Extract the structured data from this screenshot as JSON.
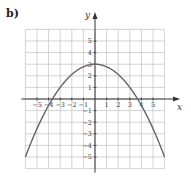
{
  "panel_label": "b)",
  "chart_data": {
    "type": "line",
    "title": "",
    "xlabel": "x",
    "ylabel": "y",
    "xlim": [
      -6,
      6
    ],
    "ylim": [
      -6,
      6
    ],
    "grid": true,
    "x_tick_labels": [
      "−5",
      "−4",
      "−3",
      "−2",
      "−1",
      "1",
      "2",
      "3",
      "4",
      "5"
    ],
    "x_tick_values": [
      -5,
      -4,
      -3,
      -2,
      -1,
      1,
      2,
      3,
      4,
      5
    ],
    "y_tick_labels": [
      "5",
      "4",
      "3",
      "2",
      "1",
      "−1",
      "−2",
      "−3",
      "−4",
      "−5"
    ],
    "y_tick_values": [
      5,
      4,
      3,
      2,
      1,
      -1,
      -2,
      -3,
      -4,
      -5
    ],
    "series": [
      {
        "name": "parabola",
        "description": "downward-opening parabola, vertex (0, 3), x-intercepts ≈ ±3.67",
        "equation": "y = 3 - (2/9)x^2",
        "x": [
          -6,
          -5,
          -4,
          -3,
          -2,
          -1,
          0,
          1,
          2,
          3,
          4,
          5,
          6
        ],
        "y": [
          -5,
          -2.56,
          -0.56,
          1,
          2.11,
          2.78,
          3,
          2.78,
          2.11,
          1,
          -0.56,
          -2.56,
          -5
        ],
        "color": "#666666"
      }
    ]
  }
}
